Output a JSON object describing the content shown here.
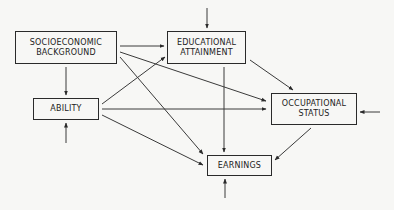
{
  "diagram": {
    "type": "path-diagram",
    "line_color": "#3a3a3a",
    "nodes": [
      {
        "id": "ses",
        "lines": [
          "SOCIOECONOMIC",
          "BACKGROUND"
        ],
        "x": 15,
        "y": 31,
        "w": 102,
        "h": 33
      },
      {
        "id": "edu",
        "lines": [
          "EDUCATIONAL",
          "ATTAINMENT"
        ],
        "x": 167,
        "y": 31,
        "w": 79,
        "h": 33
      },
      {
        "id": "ability",
        "lines": [
          "ABILITY"
        ],
        "x": 33,
        "y": 98,
        "w": 66,
        "h": 22
      },
      {
        "id": "occ",
        "lines": [
          "OCCUPATIONAL",
          "STATUS"
        ],
        "x": 271,
        "y": 93,
        "w": 86,
        "h": 32
      },
      {
        "id": "earn",
        "lines": [
          "EARNINGS"
        ],
        "x": 207,
        "y": 155,
        "w": 65,
        "h": 21
      }
    ],
    "edges": [
      {
        "from": "ses",
        "to": "edu",
        "x1": 120,
        "y1": 46,
        "x2": 164,
        "y2": 46
      },
      {
        "from": "ses",
        "to": "ability",
        "x1": 66,
        "y1": 67,
        "x2": 66,
        "y2": 95
      },
      {
        "from": "ses",
        "to": "occ",
        "x1": 120,
        "y1": 52,
        "x2": 266,
        "y2": 101
      },
      {
        "from": "ses",
        "to": "earn",
        "x1": 120,
        "y1": 57,
        "x2": 203,
        "y2": 154
      },
      {
        "from": "ability",
        "to": "edu",
        "x1": 102,
        "y1": 104,
        "x2": 165,
        "y2": 57
      },
      {
        "from": "ability",
        "to": "occ",
        "x1": 102,
        "y1": 109,
        "x2": 266,
        "y2": 109
      },
      {
        "from": "ability",
        "to": "earn",
        "x1": 102,
        "y1": 115,
        "x2": 203,
        "y2": 165
      },
      {
        "from": "edu",
        "to": "occ",
        "x1": 250,
        "y1": 60,
        "x2": 293,
        "y2": 90
      },
      {
        "from": "edu",
        "to": "earn",
        "x1": 224,
        "y1": 67,
        "x2": 224,
        "y2": 152
      },
      {
        "from": "occ",
        "to": "earn",
        "x1": 311,
        "y1": 128,
        "x2": 275,
        "y2": 160
      },
      {
        "from": "disturbance-edu",
        "to": "edu",
        "x1": 207,
        "y1": 8,
        "x2": 207,
        "y2": 28
      },
      {
        "from": "disturbance-ability",
        "to": "ability",
        "x1": 66,
        "y1": 143,
        "x2": 66,
        "y2": 123
      },
      {
        "from": "disturbance-occ",
        "to": "occ",
        "x1": 380,
        "y1": 112,
        "x2": 360,
        "y2": 112
      },
      {
        "from": "disturbance-earn",
        "to": "earn",
        "x1": 225,
        "y1": 198,
        "x2": 225,
        "y2": 179
      }
    ]
  }
}
